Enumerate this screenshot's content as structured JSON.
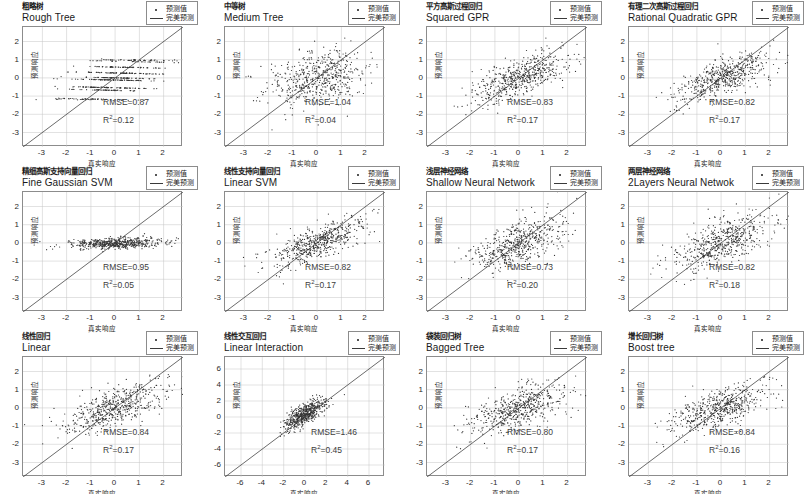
{
  "figure": {
    "type": "scatter-grid",
    "rows": 3,
    "cols": 4,
    "axis_labels": {
      "x": "真实响应",
      "y": "预测响应"
    },
    "legend": {
      "items": [
        {
          "symbol": "dot-marker-icon",
          "label": "预测值"
        },
        {
          "symbol": "line-marker-icon",
          "label": "完美预测"
        }
      ]
    },
    "colors": {
      "marker": "#333333",
      "reference_line": "#3a3a3a",
      "grid": "#bfbfbf",
      "axis": "#8c8c8c",
      "metric_text": "#3d3d3d"
    }
  },
  "panels": [
    {
      "id": "rough-tree",
      "title_cn": "粗略树",
      "title_en": "Rough Tree",
      "rmse_label": "RMSE=0.87",
      "r2_label": "R",
      "r2_sup": "2",
      "r2_value": "=0.12",
      "rmse": 0.87,
      "r2": 0.12,
      "xlim": [
        -3.8,
        2.8
      ],
      "ylim": [
        -3.8,
        2.8
      ],
      "xticks": [
        -3,
        -2,
        -1,
        0,
        1,
        2
      ],
      "yticks": [
        -3,
        -2,
        -1,
        0,
        1,
        2
      ],
      "n_points": 560,
      "scatter_kind": "steps",
      "spread_x": 1.0,
      "spread_y": 0.55,
      "corr": 0.35
    },
    {
      "id": "medium-tree",
      "title_cn": "中等树",
      "title_en": "Medium Tree",
      "rmse_label": "RMSE=1.04",
      "r2_label": "R",
      "r2_sup": "2",
      "r2_value": "=0.04",
      "rmse": 1.04,
      "r2": 0.04,
      "xlim": [
        -3.8,
        2.8
      ],
      "ylim": [
        -3.8,
        2.8
      ],
      "xticks": [
        -3,
        -2,
        -1,
        0,
        1,
        2
      ],
      "yticks": [
        -3,
        -2,
        -1,
        0,
        1,
        2
      ],
      "n_points": 560,
      "scatter_kind": "cloud",
      "spread_x": 1.0,
      "spread_y": 0.75,
      "corr": 0.22
    },
    {
      "id": "squared-gpr",
      "title_cn": "平方高斯过程回归",
      "title_en": "Squared GPR",
      "rmse_label": "RMSE=0.83",
      "r2_label": "R",
      "r2_sup": "2",
      "r2_value": "=0.17",
      "rmse": 0.83,
      "r2": 0.17,
      "xlim": [
        -3.8,
        2.8
      ],
      "ylim": [
        -3.8,
        2.8
      ],
      "xticks": [
        -3,
        -2,
        -1,
        0,
        1,
        2
      ],
      "yticks": [
        -3,
        -2,
        -1,
        0,
        1,
        2
      ],
      "n_points": 560,
      "scatter_kind": "cloud",
      "spread_x": 1.0,
      "spread_y": 0.52,
      "corr": 0.44
    },
    {
      "id": "rational-quadratic-gpr",
      "title_cn": "有理二次高斯过程回归",
      "title_en": "Rational Quadratic GPR",
      "rmse_label": "RMSE=0.82",
      "r2_label": "R",
      "r2_sup": "2",
      "r2_value": "=0.17",
      "rmse": 0.82,
      "r2": 0.17,
      "xlim": [
        -3.8,
        2.8
      ],
      "ylim": [
        -3.8,
        2.8
      ],
      "xticks": [
        -3,
        -2,
        -1,
        0,
        1,
        2
      ],
      "yticks": [
        -3,
        -2,
        -1,
        0,
        1,
        2
      ],
      "n_points": 560,
      "scatter_kind": "cloud",
      "spread_x": 1.0,
      "spread_y": 0.52,
      "corr": 0.44
    },
    {
      "id": "fine-gaussian-svm",
      "title_cn": "精细高斯支持向量回归",
      "title_en": "Fine Gaussian SVM",
      "rmse_label": "RMSE=0.95",
      "r2_label": "R",
      "r2_sup": "2",
      "r2_value": "=0.05",
      "rmse": 0.95,
      "r2": 0.05,
      "xlim": [
        -3.8,
        2.8
      ],
      "ylim": [
        -3.8,
        2.8
      ],
      "xticks": [
        -3,
        -2,
        -1,
        0,
        1,
        2
      ],
      "yticks": [
        -3,
        -2,
        -1,
        0,
        1,
        2
      ],
      "n_points": 560,
      "scatter_kind": "flat",
      "spread_x": 1.0,
      "spread_y": 0.16,
      "corr": 0.32
    },
    {
      "id": "linear-svm",
      "title_cn": "线性支持向量回归",
      "title_en": "Linear SVM",
      "rmse_label": "RMSE=0.82",
      "r2_label": "R",
      "r2_sup": "2",
      "r2_value": "=0.17",
      "rmse": 0.82,
      "r2": 0.17,
      "xlim": [
        -3.8,
        2.8
      ],
      "ylim": [
        -3.8,
        2.8
      ],
      "xticks": [
        -3,
        -2,
        -1,
        0,
        1,
        2
      ],
      "yticks": [
        -3,
        -2,
        -1,
        0,
        1,
        2
      ],
      "n_points": 560,
      "scatter_kind": "cloud",
      "spread_x": 1.0,
      "spread_y": 0.45,
      "corr": 0.45
    },
    {
      "id": "shallow-neural-network",
      "title_cn": "浅层神经网络",
      "title_en": "Shallow Neural Network",
      "rmse_label": "RMSE=0.73",
      "r2_label": "R",
      "r2_sup": "2",
      "r2_value": "=0.20",
      "rmse": 0.73,
      "r2": 0.2,
      "xlim": [
        -3.8,
        2.8
      ],
      "ylim": [
        -3.8,
        2.8
      ],
      "xticks": [
        -3,
        -2,
        -1,
        0,
        1,
        2
      ],
      "yticks": [
        -3,
        -2,
        -1,
        0,
        1,
        2
      ],
      "n_points": 560,
      "scatter_kind": "cloud",
      "spread_x": 1.0,
      "spread_y": 0.6,
      "corr": 0.47
    },
    {
      "id": "2layers-neural-network",
      "title_cn": "两层神经网络",
      "title_en": "2Layers Neural Netwok",
      "rmse_label": "RMSE=0.82",
      "r2_label": "R",
      "r2_sup": "2",
      "r2_value": "=0.18",
      "rmse": 0.82,
      "r2": 0.18,
      "xlim": [
        -3.8,
        2.8
      ],
      "ylim": [
        -3.8,
        2.8
      ],
      "xticks": [
        -3,
        -2,
        -1,
        0,
        1,
        2
      ],
      "yticks": [
        -3,
        -2,
        -1,
        0,
        1,
        2
      ],
      "n_points": 560,
      "scatter_kind": "cloud",
      "spread_x": 1.0,
      "spread_y": 0.6,
      "corr": 0.45
    },
    {
      "id": "linear",
      "title_cn": "线性回归",
      "title_en": "Linear",
      "rmse_label": "RMSE=0.84",
      "r2_label": "R",
      "r2_sup": "2",
      "r2_value": "=0.17",
      "rmse": 0.84,
      "r2": 0.17,
      "xlim": [
        -3.8,
        2.8
      ],
      "ylim": [
        -3.8,
        2.8
      ],
      "xticks": [
        -3,
        -2,
        -1,
        0,
        1,
        2
      ],
      "yticks": [
        -3,
        -2,
        -1,
        0,
        1,
        2
      ],
      "n_points": 560,
      "scatter_kind": "cloud",
      "spread_x": 1.0,
      "spread_y": 0.5,
      "corr": 0.44
    },
    {
      "id": "linear-interaction",
      "title_cn": "线性交互回归",
      "title_en": "Linear Interaction",
      "rmse_label": "RMSE=1.46",
      "r2_label": "R",
      "r2_sup": "2",
      "r2_value": "=0.45",
      "rmse": 1.46,
      "r2": 0.45,
      "xlim": [
        -7.5,
        7.5
      ],
      "ylim": [
        -7.5,
        7.5
      ],
      "xticks": [
        -6,
        -4,
        -2,
        0,
        2,
        4,
        6
      ],
      "yticks": [
        -6,
        -4,
        -2,
        0,
        2,
        4,
        6
      ],
      "n_points": 560,
      "scatter_kind": "tight",
      "spread_x": 1.0,
      "spread_y": 0.9,
      "corr": 0.6
    },
    {
      "id": "bagged-tree",
      "title_cn": "袋装回归树",
      "title_en": "Bagged Tree",
      "rmse_label": "RMSE=0.80",
      "r2_label": "R",
      "r2_sup": "2",
      "r2_value": "=0.17",
      "rmse": 0.8,
      "r2": 0.17,
      "xlim": [
        -3.8,
        2.8
      ],
      "ylim": [
        -3.8,
        2.8
      ],
      "xticks": [
        -3,
        -2,
        -1,
        0,
        1,
        2
      ],
      "yticks": [
        -3,
        -2,
        -1,
        0,
        1,
        2
      ],
      "n_points": 560,
      "scatter_kind": "cloud",
      "spread_x": 1.0,
      "spread_y": 0.55,
      "corr": 0.45
    },
    {
      "id": "boost-tree",
      "title_cn": "增长回归树",
      "title_en": "Boost tree",
      "rmse_label": "RMSE=0.84",
      "r2_label": "R",
      "r2_sup": "2",
      "r2_value": "=0.16",
      "rmse": 0.84,
      "r2": 0.16,
      "xlim": [
        -3.8,
        2.8
      ],
      "ylim": [
        -3.8,
        2.8
      ],
      "xticks": [
        -3,
        -2,
        -1,
        0,
        1,
        2
      ],
      "yticks": [
        -3,
        -2,
        -1,
        0,
        1,
        2
      ],
      "n_points": 560,
      "scatter_kind": "cloud",
      "spread_x": 1.0,
      "spread_y": 0.55,
      "corr": 0.43
    }
  ],
  "chart_data": {
    "type": "scatter",
    "title": "",
    "xlabel": "真实响应",
    "ylabel": "预测响应",
    "grid": true,
    "legend_position": "top-right",
    "legend_entries": [
      "预测值",
      "完美预测"
    ],
    "subplots": [
      {
        "name": "Rough Tree",
        "name_cn": "粗略树",
        "rmse": 0.87,
        "r2": 0.12,
        "xlim": [
          -3.8,
          2.8
        ],
        "ylim": [
          -3.8,
          2.8
        ]
      },
      {
        "name": "Medium Tree",
        "name_cn": "中等树",
        "rmse": 1.04,
        "r2": 0.04,
        "xlim": [
          -3.8,
          2.8
        ],
        "ylim": [
          -3.8,
          2.8
        ]
      },
      {
        "name": "Squared GPR",
        "name_cn": "平方高斯过程回归",
        "rmse": 0.83,
        "r2": 0.17,
        "xlim": [
          -3.8,
          2.8
        ],
        "ylim": [
          -3.8,
          2.8
        ]
      },
      {
        "name": "Rational Quadratic GPR",
        "name_cn": "有理二次高斯过程回归",
        "rmse": 0.82,
        "r2": 0.17,
        "xlim": [
          -3.8,
          2.8
        ],
        "ylim": [
          -3.8,
          2.8
        ]
      },
      {
        "name": "Fine Gaussian SVM",
        "name_cn": "精细高斯支持向量回归",
        "rmse": 0.95,
        "r2": 0.05,
        "xlim": [
          -3.8,
          2.8
        ],
        "ylim": [
          -3.8,
          2.8
        ]
      },
      {
        "name": "Linear SVM",
        "name_cn": "线性支持向量回归",
        "rmse": 0.82,
        "r2": 0.17,
        "xlim": [
          -3.8,
          2.8
        ],
        "ylim": [
          -3.8,
          2.8
        ]
      },
      {
        "name": "Shallow Neural Network",
        "name_cn": "浅层神经网络",
        "rmse": 0.73,
        "r2": 0.2,
        "xlim": [
          -3.8,
          2.8
        ],
        "ylim": [
          -3.8,
          2.8
        ]
      },
      {
        "name": "2Layers Neural Netwok",
        "name_cn": "两层神经网络",
        "rmse": 0.82,
        "r2": 0.18,
        "xlim": [
          -3.8,
          2.8
        ],
        "ylim": [
          -3.8,
          2.8
        ]
      },
      {
        "name": "Linear",
        "name_cn": "线性回归",
        "rmse": 0.84,
        "r2": 0.17,
        "xlim": [
          -3.8,
          2.8
        ],
        "ylim": [
          -3.8,
          2.8
        ]
      },
      {
        "name": "Linear Interaction",
        "name_cn": "线性交互回归",
        "rmse": 1.46,
        "r2": 0.45,
        "xlim": [
          -7.5,
          7.5
        ],
        "ylim": [
          -7.5,
          7.5
        ]
      },
      {
        "name": "Bagged Tree",
        "name_cn": "袋装回归树",
        "rmse": 0.8,
        "r2": 0.17,
        "xlim": [
          -3.8,
          2.8
        ],
        "ylim": [
          -3.8,
          2.8
        ]
      },
      {
        "name": "Boost tree",
        "name_cn": "增长回归树",
        "rmse": 0.84,
        "r2": 0.16,
        "xlim": [
          -3.8,
          2.8
        ],
        "ylim": [
          -3.8,
          2.8
        ]
      }
    ]
  }
}
